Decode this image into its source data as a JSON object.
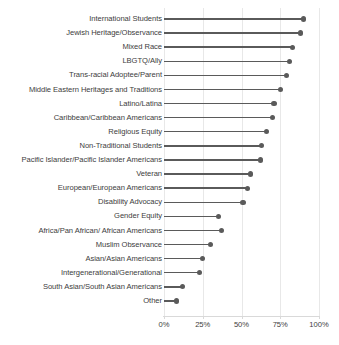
{
  "chart_data": {
    "type": "bar",
    "subtype": "lollipop-horizontal",
    "title": "",
    "subtitle": "",
    "xlabel": "",
    "ylabel": "",
    "xlim": [
      0,
      100
    ],
    "grid": true,
    "legend": null,
    "xticks": [
      "0%",
      "25%",
      "50%",
      "75%",
      "100%"
    ],
    "xtick_values": [
      0,
      25,
      50,
      75,
      100
    ],
    "categories": [
      "International Students",
      "Jewish Heritage/Observance",
      "Mixed Race",
      "LBGTQ/Ally",
      "Trans-racial Adoptee/Parent",
      "Middle Eastern Heritages and Traditions",
      "Latino/Latina",
      "Caribbean/Caribbean Americans",
      "Religious Equity",
      "Non-Traditional Students",
      "Pacific Islander/Pacific Islander Americans",
      "Veteran",
      "European/European Americans",
      "Disability Advocacy",
      "Gender Equity",
      "Africa/Pan African/ African Americans",
      "Muslim Observance",
      "Asian/Asian Americans",
      "Intergenerational/Generational",
      "South Asian/South Asian Americans",
      "Other"
    ],
    "values": [
      90,
      88,
      83,
      81,
      79,
      75,
      71,
      70,
      66,
      63,
      62,
      56,
      54,
      51,
      35,
      37,
      30,
      25,
      23,
      12,
      8
    ],
    "colors": {
      "marker": "#5a5a5a",
      "stem": "#5a5a5a",
      "grid": "#e8e8e8",
      "axis": "#d9d9d9",
      "text": "#3d3d3d",
      "background": "#ffffff"
    }
  }
}
